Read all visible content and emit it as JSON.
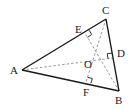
{
  "diagram": {
    "type": "triangle-altitudes",
    "points": {
      "A": {
        "x": 22,
        "y": 70,
        "label": "A",
        "lx": 10,
        "ly": 74
      },
      "B": {
        "x": 119,
        "y": 91,
        "label": "B",
        "lx": 115,
        "ly": 104
      },
      "C": {
        "x": 106,
        "y": 19,
        "label": "C",
        "lx": 102,
        "ly": 14
      },
      "D": {
        "x": 113,
        "y": 58,
        "label": "D",
        "lx": 117,
        "ly": 57
      },
      "E": {
        "x": 85,
        "y": 33,
        "label": "E",
        "lx": 75,
        "ly": 33
      },
      "F": {
        "x": 86,
        "y": 82,
        "label": "F",
        "lx": 83,
        "ly": 96
      },
      "O": {
        "x": 93,
        "y": 63,
        "label": "O",
        "lx": 84,
        "ly": 68
      }
    },
    "solid_segments": [
      [
        "A",
        "B"
      ],
      [
        "B",
        "C"
      ],
      [
        "C",
        "A"
      ]
    ],
    "dashed_segments": [
      [
        "A",
        "D"
      ],
      [
        "C",
        "F"
      ],
      [
        "B",
        "E"
      ]
    ],
    "right_angles": [
      "E",
      "D",
      "F"
    ],
    "colors": {
      "solid": "#1a1a1a",
      "dashed": "#999999",
      "text": "#222222"
    }
  }
}
